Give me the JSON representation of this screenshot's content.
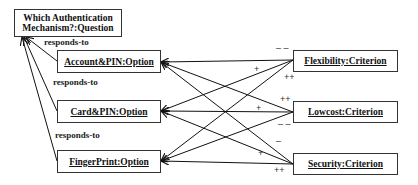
{
  "question": {
    "label": "Which Authentication Mechanism?:Question",
    "line1": "Which Authentication",
    "line2": "Mechanism?:Question"
  },
  "options": [
    {
      "label": "Account&PIN:Option"
    },
    {
      "label": "Card&PIN:Option"
    },
    {
      "label": "FingerPrint:Option"
    }
  ],
  "criteria": [
    {
      "label": "Flexibility:Criterion"
    },
    {
      "label": "Lowcost:Criterion"
    },
    {
      "label": "Security:Criterion"
    }
  ],
  "relation_label": "responds-to",
  "contributions": [
    {
      "criterion": "Flexibility",
      "option": "Account&PIN",
      "sign": "--"
    },
    {
      "criterion": "Flexibility",
      "option": "Card&PIN",
      "sign": "+"
    },
    {
      "criterion": "Flexibility",
      "option": "FingerPrint",
      "sign": "++"
    },
    {
      "criterion": "Lowcost",
      "option": "Account&PIN",
      "sign": "++"
    },
    {
      "criterion": "Lowcost",
      "option": "Card&PIN",
      "sign": "+"
    },
    {
      "criterion": "Lowcost",
      "option": "FingerPrint",
      "sign": "--"
    },
    {
      "criterion": "Security",
      "option": "Account&PIN",
      "sign": "-"
    },
    {
      "criterion": "Security",
      "option": "Card&PIN",
      "sign": "+"
    },
    {
      "criterion": "Security",
      "option": "FingerPrint",
      "sign": "++"
    }
  ],
  "signs": {
    "s1": "– –",
    "s2": "+",
    "s3": "++",
    "s4": "++",
    "s5": "+",
    "s6": "– –",
    "s7": "–",
    "s8": "+",
    "s9": "++"
  }
}
